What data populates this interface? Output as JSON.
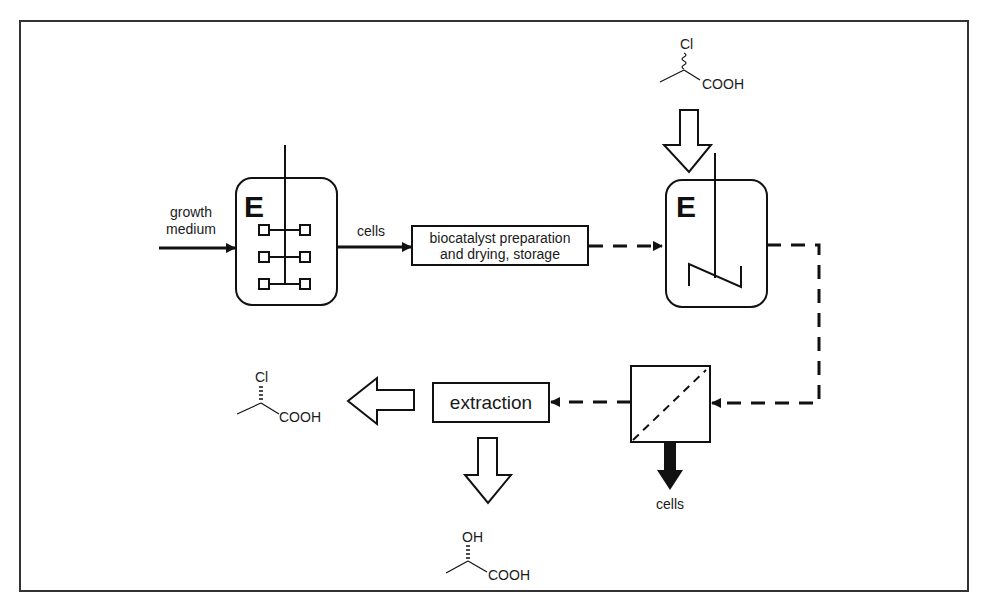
{
  "diagram": {
    "type": "process-flow",
    "colors": {
      "line": "#111111",
      "background": "#ffffff",
      "text": "#1a1a1a"
    },
    "inputs": {
      "growth_medium_line1": "growth",
      "growth_medium_line2": "medium",
      "substrate": {
        "substituent": "Cl",
        "group": "COOH",
        "stereo": "racemic (wavy bond)"
      }
    },
    "fermenter": {
      "label": "E",
      "impeller": "rushton-turbine"
    },
    "cells_label": "cells",
    "biocatalyst_box": {
      "line1": "biocatalyst preparation",
      "line2": "and drying, storage"
    },
    "reactor": {
      "label": "E",
      "impeller": "anchor/helical"
    },
    "separator": {
      "type": "membrane-filter",
      "cells_out_label": "cells"
    },
    "extraction_box": {
      "label": "extraction"
    },
    "products": {
      "remaining_acid": {
        "substituent": "Cl",
        "group": "COOH",
        "stereo": "hashed wedge"
      },
      "hydroxy_acid": {
        "substituent": "OH",
        "group": "COOH",
        "stereo": "hashed wedge"
      }
    }
  }
}
